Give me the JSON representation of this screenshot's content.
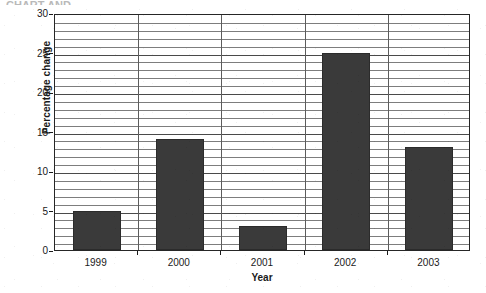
{
  "figure": {
    "top_crop_artifact": "CHART AND"
  },
  "chart_data": {
    "type": "bar",
    "title": "",
    "xlabel": "Year",
    "ylabel": "Percentage change",
    "categories": [
      "1999",
      "2000",
      "2001",
      "2002",
      "2003"
    ],
    "values": [
      5,
      14,
      3,
      25,
      13
    ],
    "series": [
      {
        "name": "Percentage change",
        "values": [
          5,
          14,
          3,
          25,
          13
        ]
      }
    ],
    "ylim": [
      0,
      30
    ],
    "y_ticks": [
      0,
      5,
      10,
      15,
      20,
      25,
      30
    ],
    "y_tick_labels": [
      "0",
      "5",
      "10",
      "15",
      "20",
      "25",
      "30"
    ],
    "y_minor_tick_step": 1,
    "grid": "horizontal-major-and-minor-plus-vertical-category-dividers",
    "legend": "none",
    "bar_color": "#3a3a3a",
    "bar_edge_color": "#2b2b2b",
    "plot_border_color": "#262626",
    "gridline_color": "#7d7d7d",
    "background_color": "#ffffff"
  }
}
